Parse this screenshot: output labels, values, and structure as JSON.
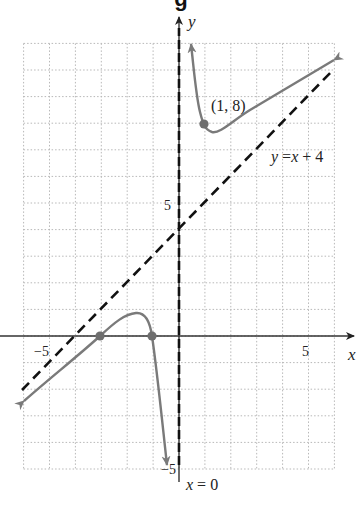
{
  "title_fragment": "g",
  "chart_data": {
    "type": "line",
    "title": "",
    "xlabel": "x",
    "ylabel": "y",
    "xlim": [
      -6,
      6
    ],
    "ylim": [
      -5,
      11
    ],
    "grid": true,
    "grid_style": "dotted",
    "x_ticks_labeled": [
      {
        "value": -5,
        "label": "−5"
      },
      {
        "value": 5,
        "label": "5"
      }
    ],
    "y_ticks_labeled": [
      {
        "value": 5,
        "label": "5"
      },
      {
        "value": -5,
        "label": "−5"
      }
    ],
    "series": [
      {
        "name": "f(x) right branch",
        "style": "solid gray with arrows",
        "points": [
          [
            0.45,
            10.9
          ],
          [
            0.7,
            9.4
          ],
          [
            1,
            8
          ],
          [
            1.5,
            7.3
          ],
          [
            2,
            7.3
          ],
          [
            3,
            7.9
          ],
          [
            4,
            8.7
          ],
          [
            5,
            9.6
          ],
          [
            6,
            10.4
          ]
        ]
      },
      {
        "name": "f(x) left branch",
        "style": "solid gray with arrows",
        "points": [
          [
            -6,
            -2.5
          ],
          [
            -5,
            -1.6
          ],
          [
            -4,
            -0.8
          ],
          [
            -3,
            0
          ],
          [
            -2.5,
            0.55
          ],
          [
            -1.7,
            0.85
          ],
          [
            -1.3,
            0.6
          ],
          [
            -1,
            0
          ],
          [
            -0.8,
            -1.7
          ],
          [
            -0.6,
            -5
          ]
        ]
      },
      {
        "name": "y = x + 4",
        "style": "dashed black",
        "points": [
          [
            -6.1,
            -2.1
          ],
          [
            6,
            10
          ]
        ]
      }
    ],
    "asymptotes": [
      {
        "label": "x = 0",
        "type": "vertical",
        "x": 0
      },
      {
        "label": "y = x + 4",
        "type": "oblique",
        "slope": 1,
        "intercept": 4
      }
    ],
    "highlighted_points": [
      {
        "x": 1,
        "y": 8,
        "label": "(1, 8)"
      },
      {
        "x": -3,
        "y": 0,
        "label": ""
      },
      {
        "x": -1,
        "y": 0,
        "label": ""
      }
    ],
    "annotations": [
      "(1, 8)",
      "y = x + 4",
      "x = 0"
    ]
  },
  "labels": {
    "x_axis": "x",
    "y_axis": "y",
    "x_tick_neg5": "−5",
    "x_tick_5": "5",
    "y_tick_5": "5",
    "y_tick_neg5": "−5",
    "point_label": "(1, 8)",
    "oblique_asymptote": {
      "y": "y",
      "eq": " =",
      "x": "x",
      "rest": " + 4"
    },
    "vertical_asymptote": {
      "x": "x",
      "rest": " = 0"
    }
  },
  "colors": {
    "curve": "#7a7a7a",
    "dot": "#6e6e6e",
    "asymptote": "#111111",
    "axis": "#333333",
    "grid": "#b8b8b8"
  }
}
